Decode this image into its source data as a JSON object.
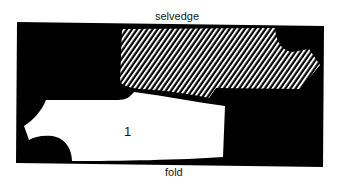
{
  "diagram": {
    "labels": {
      "top_edge": "selvedge",
      "bottom_edge": "fold"
    },
    "pieces": [
      {
        "id": "piece-1",
        "number": "1",
        "fill": "white"
      },
      {
        "id": "piece-2",
        "number": "",
        "fill": "diagonal-hatch"
      }
    ],
    "colors": {
      "fabric": "#000000",
      "piece_plain": "#ffffff",
      "hatch_line": "#ffffff",
      "background": "#ffffff"
    }
  }
}
